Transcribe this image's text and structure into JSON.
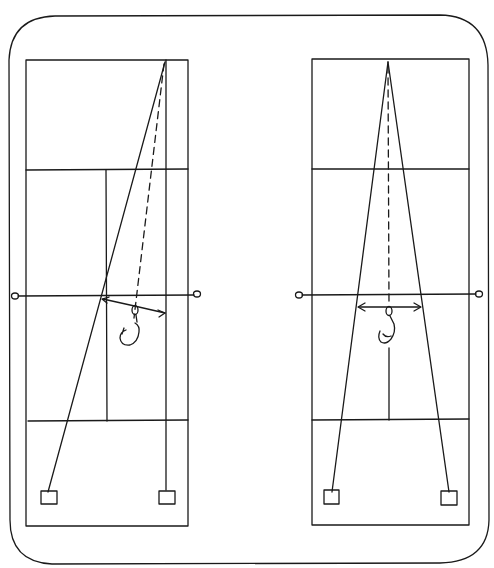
{
  "diagram": {
    "type": "hand-drawn tennis court drill diagram",
    "ink_color": "#1a1a1a",
    "background": "#ffffff",
    "panels": [
      {
        "id": "left",
        "description": "Ball fed from far baseline; player at net covers wide lane toward sideline",
        "targets": 2,
        "net_posts": 2
      },
      {
        "id": "right",
        "description": "Ball fed from center; player at net covers symmetrical lane",
        "targets": 2,
        "net_posts": 2
      }
    ]
  }
}
